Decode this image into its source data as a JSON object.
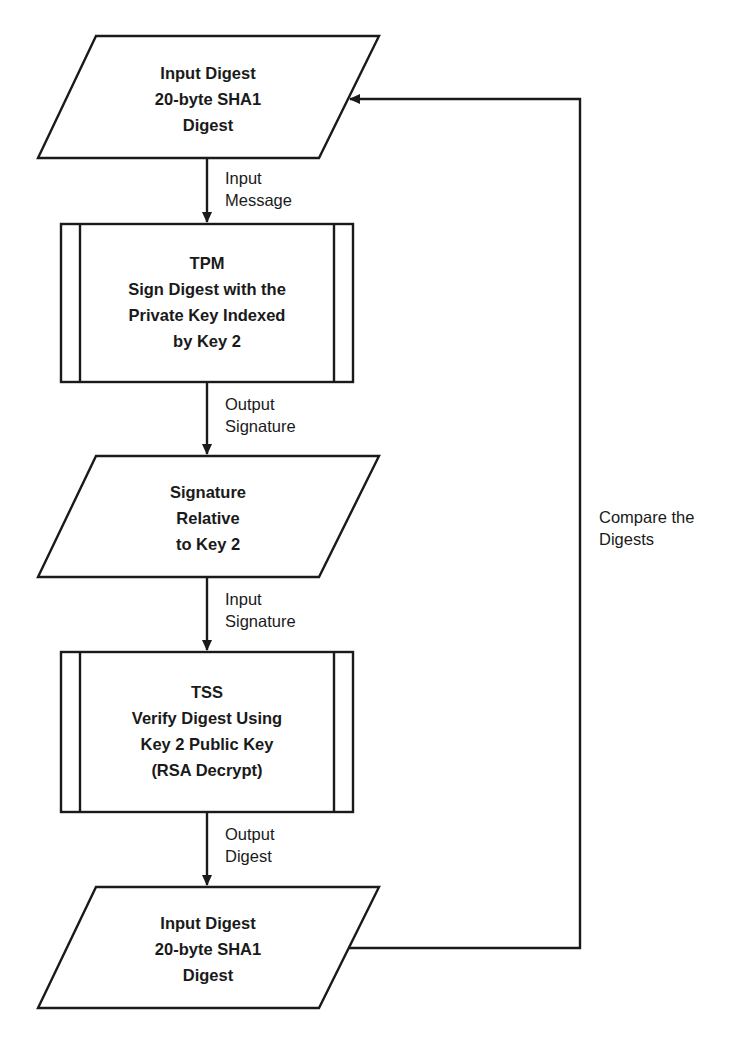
{
  "diagram": {
    "type": "flowchart",
    "stroke_color": "#1a1a1a",
    "background_color": "#ffffff",
    "nodes": [
      {
        "id": "input-digest-top",
        "shape": "parallelogram",
        "lines": [
          "Input Digest",
          "20-byte SHA1",
          "Digest"
        ]
      },
      {
        "id": "tpm-sign",
        "shape": "predefined-process",
        "lines": [
          "TPM",
          "Sign Digest with the",
          "Private Key Indexed",
          "by Key 2"
        ]
      },
      {
        "id": "signature",
        "shape": "parallelogram",
        "lines": [
          "Signature",
          "Relative",
          "to Key 2"
        ]
      },
      {
        "id": "tss-verify",
        "shape": "predefined-process",
        "lines": [
          "TSS",
          "Verify Digest Using",
          "Key 2 Public Key",
          "(RSA Decrypt)"
        ]
      },
      {
        "id": "input-digest-bottom",
        "shape": "parallelogram",
        "lines": [
          "Input Digest",
          "20-byte SHA1",
          "Digest"
        ]
      }
    ],
    "edges": [
      {
        "from": "input-digest-top",
        "to": "tpm-sign",
        "label_lines": [
          "Input",
          "Message"
        ]
      },
      {
        "from": "tpm-sign",
        "to": "signature",
        "label_lines": [
          "Output",
          "Signature"
        ]
      },
      {
        "from": "signature",
        "to": "tss-verify",
        "label_lines": [
          "Input",
          "Signature"
        ]
      },
      {
        "from": "tss-verify",
        "to": "input-digest-bottom",
        "label_lines": [
          "Output",
          "Digest"
        ]
      },
      {
        "from": "input-digest-bottom",
        "to": "input-digest-top",
        "label_lines": [
          "Compare the",
          "Digests"
        ]
      }
    ]
  }
}
